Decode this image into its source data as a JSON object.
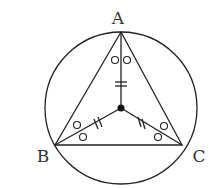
{
  "diagram": {
    "labels": {
      "A": "A",
      "B": "B",
      "C": "C"
    },
    "points": {
      "A": [
        121,
        32
      ],
      "B": [
        55,
        145
      ],
      "C": [
        182,
        145
      ],
      "O": [
        121,
        108
      ]
    },
    "circle": {
      "cx": 121,
      "cy": 108,
      "r": 76
    },
    "stroke_color": "#222222",
    "markings": {
      "equal_segments": [
        "OA",
        "OB",
        "OC"
      ],
      "equal_angles": [
        "OAB",
        "OAC",
        "OBA",
        "OBC",
        "OCA",
        "OCB"
      ]
    }
  }
}
